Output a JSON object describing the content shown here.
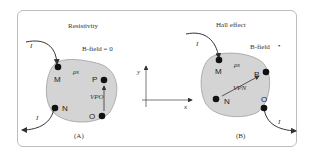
{
  "panel_a": {
    "title": "Resistivity",
    "field_label": "B-field = 0",
    "rho": "ρs",
    "contacts": [
      "M",
      "P",
      "N",
      "O"
    ],
    "voltage": "VPO",
    "current_in": "I",
    "current_out": "I",
    "caption": "(A)"
  },
  "axes": {
    "x": "x",
    "y": "y"
  },
  "panel_b": {
    "title": "Hall effect",
    "field_label": "B-field",
    "field_symbol": "•",
    "rho": "ρs",
    "contacts": [
      "M",
      "P",
      "N",
      "O"
    ],
    "voltage": "VPN",
    "current_in": "I",
    "current_out": "I",
    "caption": "(B)"
  },
  "colors": {
    "sample_fill": "#d4d4d4",
    "contact": "#111111",
    "frame": "#bdbdbd"
  }
}
